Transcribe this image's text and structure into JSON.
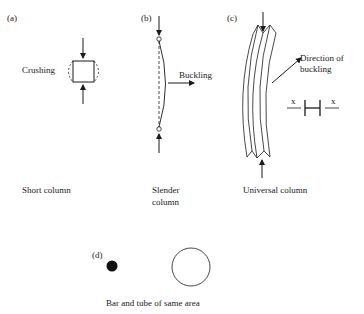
{
  "figure": {
    "panels": [
      {
        "id": "a",
        "tag": "(a)",
        "annotation": "Crushing",
        "caption": "Short column"
      },
      {
        "id": "b",
        "tag": "(b)",
        "annotation": "Buckling",
        "caption_line1": "Slender",
        "caption_line2": "column"
      },
      {
        "id": "c",
        "tag": "(c)",
        "annotation_line1": "Direction of",
        "annotation_line2": "buckling",
        "axis_left": "x",
        "axis_right": "x",
        "caption": "Universal column"
      },
      {
        "id": "d",
        "tag": "(d)",
        "caption": "Bar and tube of same area"
      }
    ],
    "colors": {
      "ink": "#1a1a1a",
      "background": "#ffffff"
    }
  }
}
